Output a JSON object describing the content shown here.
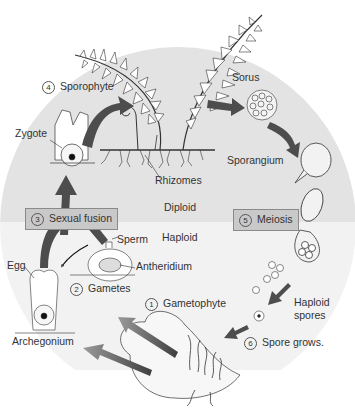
{
  "diagram": {
    "zones": {
      "diploid": "Diploid",
      "haploid": "Haploid"
    },
    "steps": [
      {
        "num": "1",
        "label": "Gametophyte"
      },
      {
        "num": "2",
        "label": "Gametes"
      },
      {
        "num": "3",
        "label": "Sexual fusion"
      },
      {
        "num": "4",
        "label": "Sporophyte"
      },
      {
        "num": "5",
        "label": "Meiosis"
      },
      {
        "num": "6",
        "label": "Spore grows."
      }
    ],
    "labels": {
      "sorus": "Sorus",
      "sporangium": "Sporangium",
      "rhizomes": "Rhizomes",
      "zygote": "Zygote",
      "sperm": "Sperm",
      "antheridium": "Antheridium",
      "egg": "Egg",
      "archegonium": "Archegonium",
      "haploid_spores_line1": "Haploid",
      "haploid_spores_line2": "spores"
    },
    "colors": {
      "diploid_bg": "#e2e2e2",
      "haploid_bg": "#f1f1f1",
      "arrow": "#555555",
      "box_bg": "#c9c9c9"
    }
  }
}
